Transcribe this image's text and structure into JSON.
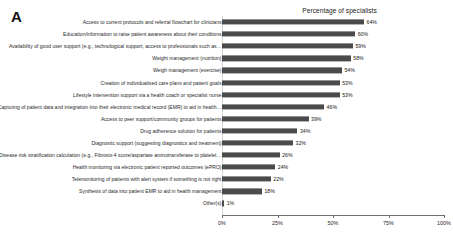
{
  "panel": {
    "letter": "A"
  },
  "chart_data": {
    "type": "bar",
    "orientation": "horizontal",
    "title": "Percentage of specialists",
    "xlabel": "",
    "ylabel": "",
    "xlim": [
      0,
      100
    ],
    "grid": false,
    "legend": null,
    "tick_labels": [
      "0%",
      "25%",
      "50%",
      "75%",
      "100%"
    ],
    "tick_values": [
      0,
      25,
      50,
      75,
      100
    ],
    "bar_color": "#4b4b4b",
    "categories": [
      "Access to current protocols and referral flowchart for clinicians",
      "Education/information to raise patient awareness about their conditions",
      "Availability of good user support (e.g., technological support, access to professionals such as…",
      "Weight management (nutrition)",
      "Weigh management (exercise)",
      "Creation of individualised care plans and patient goals",
      "Lifestyle intervention support via a health coach or specialist nurse",
      "Capturing of patient data and integration into their electronic medical record (EMR) to aid in health…",
      "Access to peer support/community groups for patients",
      "Drug adherence solution for patients",
      "Diagnostic support (suggesting diagnostics and treatment)",
      "Disease risk stratification calculation (e.g., Fibrosis-4 score/aspartate aminotransferase to platelet…",
      "Health monitoring via electronic patient reported outcomes (ePRO)",
      "Telemonitoring of patients with alert system if something is not right",
      "Synthesis of data into patient EMR to aid in health management",
      "Other(s)"
    ],
    "values": [
      64,
      60,
      59,
      58,
      54,
      53,
      53,
      46,
      39,
      34,
      32,
      26,
      24,
      22,
      18,
      1
    ],
    "value_labels": [
      "64%",
      "60%",
      "59%",
      "58%",
      "54%",
      "53%",
      "53%",
      "46%",
      "39%",
      "34%",
      "32%",
      "26%",
      "24%",
      "22%",
      "18%",
      "1%"
    ]
  }
}
